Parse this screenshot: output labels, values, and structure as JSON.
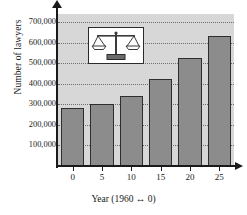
{
  "chart_data": {
    "type": "bar",
    "title": "",
    "xlabel": "Year (1960 ↔ 0)",
    "ylabel": "Number of lawyers",
    "categories": [
      "0",
      "5",
      "10",
      "15",
      "20",
      "25"
    ],
    "values": [
      282000,
      300000,
      342000,
      425000,
      527000,
      635000
    ],
    "series": [
      {
        "name": "Number of lawyers",
        "values": [
          282000,
          300000,
          342000,
          425000,
          527000,
          635000
        ]
      }
    ],
    "ylim": [
      0,
      740000
    ],
    "xlim": [
      -3,
      28
    ],
    "ytick_labels": [
      "100,000",
      "200,000",
      "300,000",
      "400,000",
      "500,000",
      "600,000",
      "700,000"
    ],
    "ytick_values": [
      100000,
      200000,
      300000,
      400000,
      500000,
      600000,
      700000
    ],
    "xtick_labels": [
      "0",
      "5",
      "10",
      "15",
      "20",
      "25"
    ],
    "xtick_values": [
      0,
      5,
      10,
      15,
      20,
      25
    ],
    "grid": true,
    "grid_axis": "y",
    "grid_style": "dotted",
    "legend": false,
    "legend_position": "none",
    "annotations": [
      {
        "name": "scales-of-justice-inset",
        "icon": "scales-of-justice-icon",
        "description": "Balance scales illustration in white bordered box inside plot area"
      }
    ],
    "colors": {
      "bar_fill": "#8c8c8c",
      "bar_edge": "#2e2e2e",
      "plot_background": "#d7d7d7",
      "figure_background": "#ffffff",
      "gridline": "#6e6e6e",
      "axis": "#1a1a1a",
      "text": "#1a1a1a"
    }
  },
  "axes": {
    "y_title": "Number of lawyers",
    "x_title": "Year (1960 ↔ 0)",
    "y_arrow": "arrow-up-icon",
    "x_arrow": "arrow-right-icon"
  }
}
